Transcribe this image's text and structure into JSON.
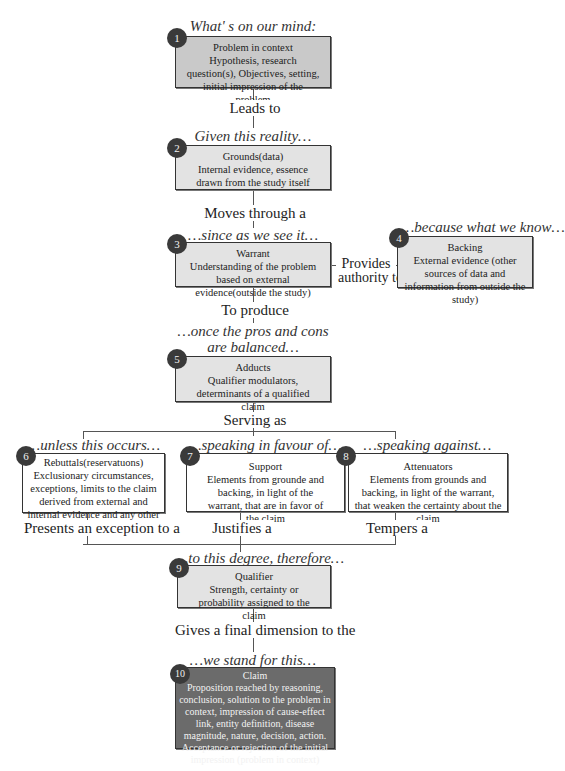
{
  "diagram": {
    "type": "Toulmin argument model flowchart",
    "nodes": [
      {
        "id": 1,
        "caption": "What' s on our mind:",
        "title": "Problem in context",
        "body": "Hypothesis, research question(s), Objectives, setting, initial impression of the problem"
      },
      {
        "id": 2,
        "caption": "Given this reality…",
        "title": "Grounds(data)",
        "body": "Internal evidence, essence drawn from the study itself"
      },
      {
        "id": 3,
        "caption": "…since as we see it…",
        "title": "Warrant",
        "body": "Understanding of the problem based on external evidence(outside the study)"
      },
      {
        "id": 4,
        "caption": "…because what we know…",
        "title": "Backing",
        "body": "External evidence (other sources of data and information from outside the study)"
      },
      {
        "id": 5,
        "caption": "…once the pros and cons are balanced…",
        "title": "Adducts",
        "body": "Qualifier modulators, determinants of a qualified claim"
      },
      {
        "id": 6,
        "caption": "…unless this occurs…",
        "title": "Rebuttals(reservatuons)",
        "body": "Exclusionary circumstances, exceptions, limits to the claim derived from external and internal evidence and any other possible source"
      },
      {
        "id": 7,
        "caption": "…speaking in favour of…",
        "title": "Support",
        "body": "Elements from grounde and backing, in light of the warrant, that are in favor of the claim"
      },
      {
        "id": 8,
        "caption": "…speaking against…",
        "title": "Attenuators",
        "body": "Elements from grounds and backing, in light of the warrant, that weaken the certainty about the claim"
      },
      {
        "id": 9,
        "caption": "…to this degree, therefore…",
        "title": "Qualifier",
        "body": "Strength, certainty or probability assigned to the claim"
      },
      {
        "id": 10,
        "caption": "…we stand for this…",
        "title": "Claim",
        "body": "Proposition reached by reasoning, conclusion, solution to the problem in context, impression of cause-effect link, entity definition, disease magnitude, nature, decision, action. Acceptance or rejection of the initial impression (problem in context)"
      }
    ],
    "edges": {
      "e1_2": "Leads to",
      "e2_3": "Moves through a",
      "e4_3_a": "Provides",
      "e4_3_b": "authority to",
      "e3_5": "To produce",
      "e5_split": "Serving as",
      "e6_9": "Presents an exception to a",
      "e7_9": "Justifies a",
      "e8_9": "Tempers a",
      "e9_10": "Gives a final dimension to the"
    },
    "colors": {
      "gray_box": "#c9c9c9",
      "light_box": "#e3e3e3",
      "dark_box": "#6b6b6b",
      "badge": "#3a3a3a",
      "line": "#555555"
    }
  }
}
